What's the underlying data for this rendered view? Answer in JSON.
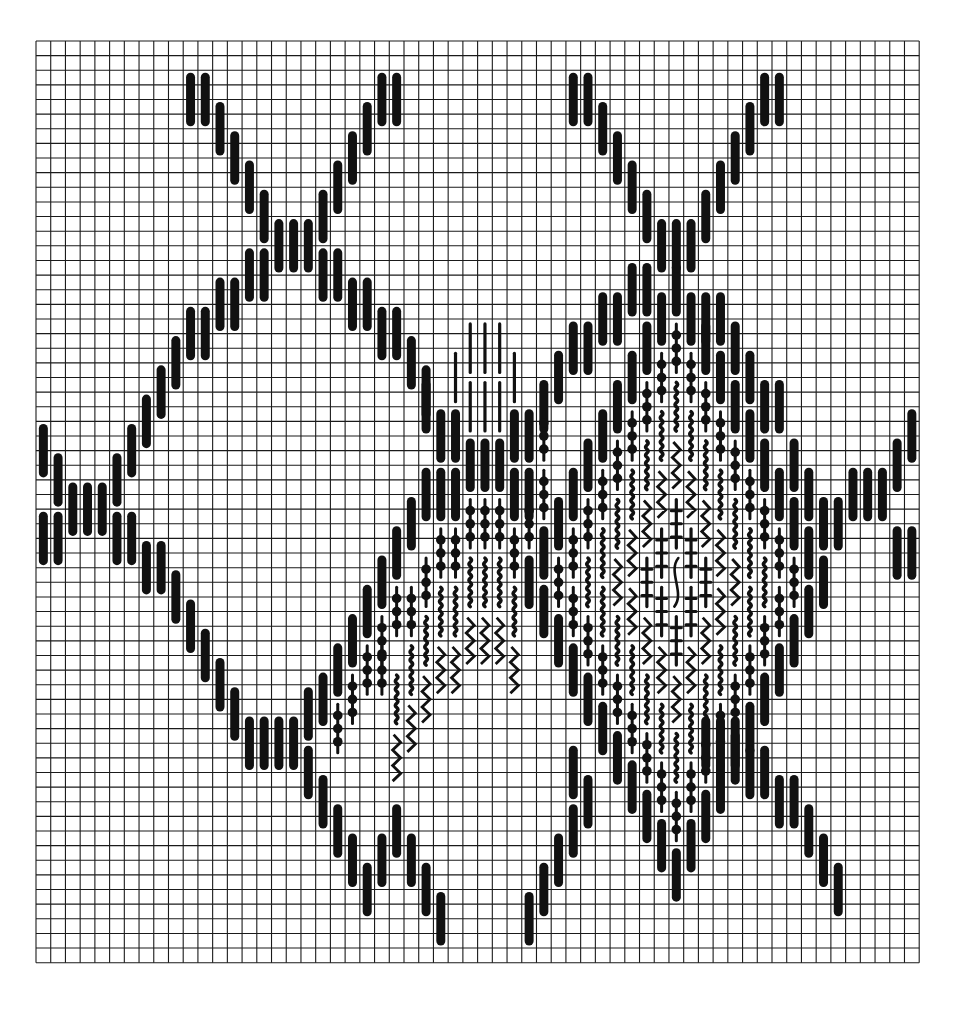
{
  "grid": {
    "cols": 60,
    "rows": 63,
    "origin_x": 36,
    "origin_y": 41,
    "cell_w": 14.72,
    "cell_h": 14.63,
    "line_color": "#1a1a1a",
    "stitch_color": "#111111",
    "background": "#ffffff"
  },
  "stitch_types": {
    "T": "thick-straight-stitch",
    "L": "thin-straight-stitch",
    "B": "beaded-stitch",
    "W": "fine-wavy-stitch",
    "Z": "zigzag-stitch",
    "X": "cross-tick-stitch",
    "S": "s-curve-stitch"
  },
  "stitch_length_rows": 4,
  "runs": [
    {
      "c": 10,
      "r": 2,
      "dc": 1,
      "dr": 0,
      "n": 2,
      "t": "T"
    },
    {
      "c": 12,
      "r": 4,
      "dc": 1,
      "dr": 2,
      "n": 4,
      "t": "T"
    },
    {
      "c": 16,
      "r": 12,
      "dc": 1,
      "dr": 0,
      "n": 3,
      "t": "T"
    },
    {
      "c": 19,
      "r": 10,
      "dc": 1,
      "dr": -2,
      "n": 4,
      "t": "T"
    },
    {
      "c": 23,
      "r": 2,
      "dc": 1,
      "dr": 0,
      "n": 2,
      "t": "T"
    },
    {
      "c": 36,
      "r": 2,
      "dc": 1,
      "dr": 0,
      "n": 2,
      "t": "T"
    },
    {
      "c": 38,
      "r": 4,
      "dc": 1,
      "dr": 2,
      "n": 4,
      "t": "T"
    },
    {
      "c": 42,
      "r": 12,
      "dc": 1,
      "dr": 0,
      "n": 3,
      "t": "T"
    },
    {
      "c": 45,
      "r": 10,
      "dc": 1,
      "dr": -2,
      "n": 4,
      "t": "T"
    },
    {
      "c": 49,
      "r": 2,
      "dc": 1,
      "dr": 0,
      "n": 2,
      "t": "T"
    },
    {
      "c": 14,
      "r": 14,
      "dc": 1,
      "dr": 0,
      "n": 2,
      "t": "T"
    },
    {
      "c": 12,
      "r": 16,
      "dc": 1,
      "dr": 0,
      "n": 2,
      "t": "T"
    },
    {
      "c": 10,
      "r": 18,
      "dc": 1,
      "dr": 0,
      "n": 2,
      "t": "T"
    },
    {
      "c": 9,
      "r": 20,
      "dc": -1,
      "dr": 2,
      "n": 4,
      "t": "T"
    },
    {
      "c": 19,
      "r": 14,
      "dc": 1,
      "dr": 0,
      "n": 2,
      "t": "T"
    },
    {
      "c": 21,
      "r": 16,
      "dc": 1,
      "dr": 0,
      "n": 2,
      "t": "T"
    },
    {
      "c": 23,
      "r": 18,
      "dc": 1,
      "dr": 0,
      "n": 2,
      "t": "T"
    },
    {
      "c": 25,
      "r": 20,
      "dc": 1,
      "dr": 2,
      "n": 2,
      "t": "T"
    },
    {
      "c": 0,
      "r": 26,
      "dc": 1,
      "dr": 2,
      "n": 2,
      "t": "T"
    },
    {
      "c": 2,
      "r": 30,
      "dc": 1,
      "dr": 0,
      "n": 3,
      "t": "T"
    },
    {
      "c": 5,
      "r": 28,
      "dc": 1,
      "dr": -2,
      "n": 1,
      "t": "T"
    },
    {
      "c": 0,
      "r": 32,
      "dc": 1,
      "dr": 0,
      "n": 2,
      "t": "T"
    },
    {
      "c": 5,
      "r": 32,
      "dc": 1,
      "dr": 0,
      "n": 2,
      "t": "T"
    },
    {
      "c": 7,
      "r": 34,
      "dc": 1,
      "dr": 0,
      "n": 2,
      "t": "T"
    },
    {
      "c": 9,
      "r": 36,
      "dc": 1,
      "dr": 2,
      "n": 4,
      "t": "T"
    },
    {
      "c": 13,
      "r": 44,
      "dc": 1,
      "dr": 2,
      "n": 2,
      "t": "T"
    },
    {
      "c": 15,
      "r": 46,
      "dc": 1,
      "dr": 0,
      "n": 3,
      "t": "T"
    },
    {
      "c": 18,
      "r": 44,
      "dc": 1,
      "dr": 2,
      "n": 1,
      "t": "T"
    },
    {
      "c": 18,
      "r": 48,
      "dc": 1,
      "dr": 2,
      "n": 5,
      "t": "T"
    },
    {
      "c": 23,
      "r": 54,
      "dc": 1,
      "dr": 0,
      "n": 1,
      "t": "T"
    },
    {
      "c": 24,
      "r": 52,
      "dc": 1,
      "dr": 2,
      "n": 4,
      "t": "T"
    },
    {
      "c": 33,
      "r": 58,
      "dc": 1,
      "dr": -2,
      "n": 3,
      "t": "T"
    },
    {
      "c": 36,
      "r": 52,
      "dc": 1,
      "dr": 0,
      "n": 1,
      "t": "T"
    },
    {
      "c": 36,
      "r": 48,
      "dc": 1,
      "dr": 0,
      "n": 1,
      "t": "T"
    },
    {
      "c": 37,
      "r": 50,
      "dc": 1,
      "dr": -2,
      "n": 1,
      "t": "T"
    },
    {
      "c": 45,
      "r": 46,
      "dc": 1,
      "dr": 0,
      "n": 3,
      "t": "T"
    },
    {
      "c": 48,
      "r": 48,
      "dc": 1,
      "dr": 0,
      "n": 2,
      "t": "T"
    },
    {
      "c": 50,
      "r": 50,
      "dc": 1,
      "dr": 0,
      "n": 2,
      "t": "T"
    },
    {
      "c": 52,
      "r": 52,
      "dc": 1,
      "dr": 2,
      "n": 3,
      "t": "T"
    },
    {
      "c": 55,
      "r": 29,
      "dc": 1,
      "dr": 0,
      "n": 3,
      "t": "T"
    },
    {
      "c": 58,
      "r": 27,
      "dc": 1,
      "dr": -2,
      "n": 2,
      "t": "T"
    },
    {
      "c": 58,
      "r": 33,
      "dc": 1,
      "dr": 0,
      "n": 2,
      "t": "T"
    },
    {
      "c": 53,
      "r": 31,
      "dc": 1,
      "dr": 0,
      "n": 2,
      "t": "T"
    },
    {
      "c": 52,
      "r": 29,
      "dc": -1,
      "dr": -2,
      "n": 1,
      "t": "T"
    },
    {
      "c": 51,
      "r": 27,
      "dc": -1,
      "dr": -2,
      "n": 1,
      "t": "T"
    },
    {
      "c": 50,
      "r": 23,
      "dc": 0,
      "dr": 0,
      "n": 1,
      "t": "T"
    },
    {
      "c": 49,
      "r": 23,
      "dc": 0,
      "dr": 0,
      "n": 1,
      "t": "T"
    },
    {
      "c": 48,
      "r": 21,
      "dc": -1,
      "dr": -2,
      "n": 2,
      "t": "T"
    },
    {
      "c": 46,
      "r": 17,
      "dc": 0,
      "dr": 0,
      "n": 1,
      "t": "T"
    },
    {
      "c": 45,
      "r": 17,
      "dc": 0,
      "dr": 0,
      "n": 1,
      "t": "T"
    },
    {
      "c": 40,
      "r": 15,
      "dc": 1,
      "dr": 0,
      "n": 1,
      "t": "T"
    },
    {
      "c": 41,
      "r": 15,
      "dc": 1,
      "dr": 0,
      "n": 1,
      "t": "T"
    },
    {
      "c": 38,
      "r": 17,
      "dc": 1,
      "dr": 0,
      "n": 2,
      "t": "T"
    },
    {
      "c": 36,
      "r": 19,
      "dc": 1,
      "dr": 0,
      "n": 2,
      "t": "T"
    },
    {
      "c": 35,
      "r": 21,
      "dc": -1,
      "dr": 2,
      "n": 2,
      "t": "T"
    },
    {
      "c": 33,
      "r": 25,
      "dc": 0,
      "dr": 0,
      "n": 1,
      "t": "T"
    },
    {
      "c": 26,
      "r": 23,
      "dc": 1,
      "dr": 2,
      "n": 2,
      "t": "T"
    },
    {
      "c": 28,
      "r": 25,
      "dc": 0,
      "dr": 0,
      "n": 1,
      "t": "T"
    },
    {
      "c": 29,
      "r": 27,
      "dc": 1,
      "dr": 0,
      "n": 3,
      "t": "T"
    },
    {
      "c": 32,
      "r": 25,
      "dc": 0,
      "dr": 0,
      "n": 1,
      "t": "T"
    },
    {
      "c": 26,
      "r": 29,
      "dc": 1,
      "dr": 0,
      "n": 3,
      "t": "T"
    },
    {
      "c": 30,
      "r": 29,
      "dc": 1,
      "dr": 0,
      "n": 0,
      "t": "T"
    },
    {
      "c": 31,
      "r": 29,
      "dc": 1,
      "dr": 0,
      "n": 0,
      "t": "T"
    },
    {
      "c": 32,
      "r": 29,
      "dc": 1,
      "dr": 0,
      "n": 1,
      "t": "T"
    },
    {
      "c": 33,
      "r": 29,
      "dc": 1,
      "dr": 0,
      "n": 1,
      "t": "T"
    },
    {
      "c": 25,
      "r": 31,
      "dc": -1,
      "dr": 2,
      "n": 3,
      "t": "T"
    },
    {
      "c": 24,
      "r": 35,
      "dc": -1,
      "dr": 0,
      "n": 0,
      "t": "T"
    },
    {
      "c": 22,
      "r": 37,
      "dc": -1,
      "dr": 2,
      "n": 2,
      "t": "T"
    },
    {
      "c": 20,
      "r": 41,
      "dc": 0,
      "dr": 0,
      "n": 1,
      "t": "T"
    },
    {
      "c": 19,
      "r": 43,
      "dc": -1,
      "dr": 0,
      "n": 1,
      "t": "T"
    },
    {
      "c": 29,
      "r": 19,
      "dc": 1,
      "dr": 0,
      "n": 3,
      "t": "L"
    },
    {
      "c": 29,
      "r": 23,
      "dc": 1,
      "dr": 0,
      "n": 3,
      "t": "L"
    },
    {
      "c": 28,
      "r": 21,
      "dc": 0,
      "dr": 0,
      "n": 1,
      "t": "L"
    },
    {
      "c": 32,
      "r": 21,
      "dc": 0,
      "dr": 0,
      "n": 1,
      "t": "L"
    },
    {
      "c": 29,
      "r": 31,
      "dc": 1,
      "dr": 0,
      "n": 3,
      "t": "B"
    },
    {
      "c": 27,
      "r": 33,
      "dc": 1,
      "dr": 0,
      "n": 2,
      "t": "B"
    },
    {
      "c": 32,
      "r": 33,
      "dc": 1,
      "dr": 0,
      "n": 1,
      "t": "B"
    },
    {
      "c": 33,
      "r": 31,
      "dc": 0,
      "dr": 0,
      "n": 1,
      "t": "B"
    },
    {
      "c": 34,
      "r": 25,
      "dc": 0,
      "dr": 0,
      "n": 1,
      "t": "B"
    },
    {
      "c": 34,
      "r": 29,
      "dc": 0,
      "dr": 0,
      "n": 1,
      "t": "B"
    },
    {
      "c": 26,
      "r": 35,
      "dc": -1,
      "dr": 2,
      "n": 2,
      "t": "B"
    },
    {
      "c": 25,
      "r": 37,
      "dc": -1,
      "dr": 2,
      "n": 0,
      "t": "B"
    },
    {
      "c": 24,
      "r": 37,
      "dc": -1,
      "dr": 2,
      "n": 2,
      "t": "B"
    },
    {
      "c": 22,
      "r": 41,
      "dc": -1,
      "dr": 2,
      "n": 2,
      "t": "B"
    },
    {
      "c": 23,
      "r": 41,
      "dc": 0,
      "dr": 0,
      "n": 1,
      "t": "B"
    },
    {
      "c": 20,
      "r": 45,
      "dc": 0,
      "dr": 0,
      "n": 1,
      "t": "B"
    },
    {
      "c": 29,
      "r": 35,
      "dc": 1,
      "dr": 0,
      "n": 3,
      "t": "W"
    },
    {
      "c": 28,
      "r": 37,
      "dc": 1,
      "dr": 0,
      "n": 1,
      "t": "W"
    },
    {
      "c": 32,
      "r": 37,
      "dc": 1,
      "dr": 0,
      "n": 1,
      "t": "W"
    },
    {
      "c": 27,
      "r": 37,
      "dc": -1,
      "dr": 2,
      "n": 4,
      "t": "W"
    },
    {
      "c": 26,
      "r": 39,
      "dc": -1,
      "dr": 2,
      "n": 3,
      "t": "W"
    },
    {
      "c": 33,
      "r": 35,
      "dc": 1,
      "dr": -2,
      "n": 1,
      "t": "W"
    },
    {
      "c": 29,
      "r": 39,
      "dc": 1,
      "dr": 0,
      "n": 3,
      "t": "Z"
    },
    {
      "c": 28,
      "r": 41,
      "dc": 0,
      "dr": 0,
      "n": 1,
      "t": "Z"
    },
    {
      "c": 27,
      "r": 41,
      "dc": -1,
      "dr": 2,
      "n": 4,
      "t": "Z"
    },
    {
      "c": 26,
      "r": 43,
      "dc": -1,
      "dr": 2,
      "n": 3,
      "t": "Z"
    },
    {
      "c": 32,
      "r": 41,
      "dc": 0,
      "dr": 0,
      "n": 1,
      "t": "Z"
    }
  ],
  "right_diamond": {
    "center_col": 43,
    "top_row": 15,
    "bands": [
      {
        "t": "T",
        "ring": 0
      },
      {
        "t": "B",
        "ring": 1
      },
      {
        "t": "W",
        "ring": 2
      },
      {
        "t": "Z",
        "ring": 3
      },
      {
        "t": "X",
        "ring": 4
      },
      {
        "t": "S",
        "ring": 5
      },
      {
        "t": "L",
        "ring": 6
      }
    ]
  }
}
